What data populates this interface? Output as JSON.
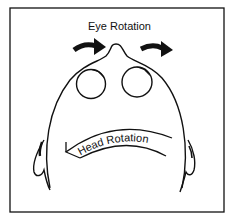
{
  "diagram": {
    "labels": {
      "eye_rotation": "Eye Rotation",
      "head_rotation": "Head Rotation"
    },
    "colors": {
      "ink": "#111111",
      "background": "#ffffff"
    }
  }
}
